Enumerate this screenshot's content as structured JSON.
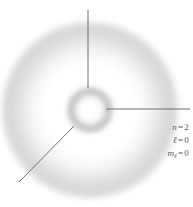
{
  "figure": {
    "background_color": "#ffffff",
    "width": 193,
    "height": 207
  },
  "cloud": {
    "description": "grayscale electron probability density cloud",
    "center_x": 90,
    "center_y": 110,
    "inner_shell_radius": 15,
    "node_radius": 24,
    "outer_shell_radius": 58,
    "cloud_color": "#787878"
  },
  "leaders": {
    "line_color": "#707070",
    "items": [
      {
        "name": "outer-shell-pointer",
        "orientation": "vertical",
        "x1": 88,
        "y1": 10,
        "x2": 88,
        "y2": 88
      },
      {
        "name": "inner-shell-pointer",
        "orientation": "horizontal",
        "x1": 106,
        "y1": 109,
        "x2": 190,
        "y2": 109
      },
      {
        "name": "node-pointer",
        "orientation": "diagonal",
        "x1": 19,
        "y1": 182,
        "x2": 74,
        "y2": 126
      }
    ]
  },
  "quantum_numbers": {
    "text_color": "#5a5a5a",
    "rows": [
      {
        "symbol": "n",
        "subscript": "",
        "equals": "=",
        "value": "2"
      },
      {
        "symbol": "ℓ",
        "subscript": "",
        "equals": "=",
        "value": "0"
      },
      {
        "symbol": "m",
        "subscript": "ℓ",
        "equals": "=",
        "value": "0"
      }
    ]
  }
}
